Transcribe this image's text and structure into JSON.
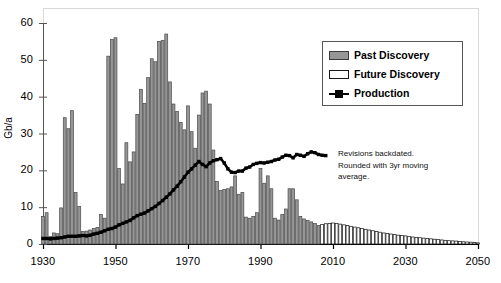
{
  "chart_data": {
    "type": "bar",
    "title": "",
    "xlabel": "",
    "ylabel": "Gb/a",
    "xlim": [
      1930,
      2050
    ],
    "ylim": [
      0,
      60
    ],
    "yticks": [
      0,
      10,
      20,
      30,
      40,
      50,
      60
    ],
    "xticks": [
      1930,
      1950,
      1970,
      1990,
      2010,
      2030,
      2050
    ],
    "xtick_labels": [
      "1930",
      "1950",
      "1970",
      "1990",
      "2010",
      "2030",
      "2050"
    ],
    "ytick_labels": [
      "0",
      "10",
      "20",
      "30",
      "40",
      "50",
      "60"
    ],
    "grid": false,
    "legend_position": "upper right",
    "annotations": [
      "Revisions backdated.",
      "Rounded with 3yr moving",
      "average."
    ],
    "legend": [
      {
        "label": "Past Discovery",
        "marker": "bar",
        "color": "#969696",
        "edge": "#3c3c3c"
      },
      {
        "label": "Future Discovery",
        "marker": "bar",
        "color": "#ffffff",
        "edge": "#1a1a1a"
      },
      {
        "label": "Production",
        "marker": "line-square",
        "color": "#000000"
      }
    ],
    "series": [
      {
        "name": "Past Discovery",
        "type": "bar",
        "color": "#969696",
        "x": [
          1930,
          1931,
          1932,
          1933,
          1934,
          1935,
          1936,
          1937,
          1938,
          1939,
          1940,
          1941,
          1942,
          1943,
          1944,
          1945,
          1946,
          1947,
          1948,
          1949,
          1950,
          1951,
          1952,
          1953,
          1954,
          1955,
          1956,
          1957,
          1958,
          1959,
          1960,
          1961,
          1962,
          1963,
          1964,
          1965,
          1966,
          1967,
          1968,
          1969,
          1970,
          1971,
          1972,
          1973,
          1974,
          1975,
          1976,
          1977,
          1978,
          1979,
          1980,
          1981,
          1982,
          1983,
          1984,
          1985,
          1986,
          1987,
          1988,
          1989,
          1990,
          1991,
          1992,
          1993,
          1994,
          1995,
          1996,
          1997,
          1998,
          1999,
          2000,
          2001,
          2002,
          2003,
          2004,
          2005,
          2006
        ],
        "values": [
          7.5,
          8.5,
          2.0,
          3.0,
          2.8,
          9.8,
          34.3,
          31.3,
          36.2,
          14.0,
          10.2,
          3.4,
          3.5,
          3.8,
          4.2,
          4.5,
          8.0,
          7.0,
          51.0,
          55.5,
          56.0,
          20.5,
          16.3,
          27.5,
          22.3,
          25.0,
          35.2,
          42.0,
          38.2,
          45.2,
          50.3,
          49.5,
          55.0,
          55.3,
          57.0,
          44.0,
          38.0,
          36.0,
          33.0,
          31.0,
          37.5,
          30.5,
          26.0,
          35.0,
          41.0,
          41.5,
          38.0,
          25.5,
          17.0,
          14.5,
          14.8,
          15.0,
          15.5,
          18.5,
          13.5,
          14.0,
          7.3,
          7.0,
          7.5,
          8.5,
          20.5,
          16.5,
          18.5,
          15.0,
          7.0,
          6.5,
          8.0,
          9.5,
          15.0,
          15.0,
          12.0,
          7.5,
          6.8,
          6.4,
          6.0,
          5.6,
          5.0
        ]
      },
      {
        "name": "Future Discovery",
        "type": "bar",
        "color": "#ffffff",
        "x": [
          2007,
          2008,
          2009,
          2010,
          2011,
          2012,
          2013,
          2014,
          2015,
          2016,
          2017,
          2018,
          2019,
          2020,
          2021,
          2022,
          2023,
          2024,
          2025,
          2026,
          2027,
          2028,
          2029,
          2030,
          2031,
          2032,
          2033,
          2034,
          2035,
          2036,
          2037,
          2038,
          2039,
          2040,
          2041,
          2042,
          2043,
          2044,
          2045,
          2046,
          2047,
          2048,
          2049,
          2050
        ],
        "values": [
          5.3,
          5.5,
          5.6,
          5.7,
          5.6,
          5.4,
          5.2,
          5.0,
          4.8,
          4.6,
          4.4,
          4.2,
          4.0,
          3.8,
          3.6,
          3.4,
          3.2,
          3.0,
          2.9,
          2.7,
          2.6,
          2.4,
          2.3,
          2.2,
          2.0,
          1.9,
          1.8,
          1.7,
          1.6,
          1.5,
          1.4,
          1.3,
          1.2,
          1.1,
          1.0,
          0.9,
          0.85,
          0.8,
          0.7,
          0.6,
          0.55,
          0.5,
          0.4,
          0.3
        ]
      },
      {
        "name": "Production",
        "type": "line",
        "color": "#000000",
        "x": [
          1930,
          1931,
          1932,
          1933,
          1934,
          1935,
          1936,
          1937,
          1938,
          1939,
          1940,
          1941,
          1942,
          1943,
          1944,
          1945,
          1946,
          1947,
          1948,
          1949,
          1950,
          1951,
          1952,
          1953,
          1954,
          1955,
          1956,
          1957,
          1958,
          1959,
          1960,
          1961,
          1962,
          1963,
          1964,
          1965,
          1966,
          1967,
          1968,
          1969,
          1970,
          1971,
          1972,
          1973,
          1974,
          1975,
          1976,
          1977,
          1978,
          1979,
          1980,
          1981,
          1982,
          1983,
          1984,
          1985,
          1986,
          1987,
          1988,
          1989,
          1990,
          1991,
          1992,
          1993,
          1994,
          1995,
          1996,
          1997,
          1998,
          1999,
          2000,
          2001,
          2002,
          2003,
          2004,
          2005,
          2006,
          2007,
          2008
        ],
        "values": [
          1.5,
          1.5,
          1.4,
          1.5,
          1.6,
          1.7,
          1.9,
          2.1,
          2.1,
          2.1,
          2.2,
          2.3,
          2.2,
          2.4,
          2.7,
          2.9,
          3.2,
          3.6,
          4.0,
          4.2,
          4.6,
          5.2,
          5.6,
          6.0,
          6.4,
          7.1,
          7.7,
          8.1,
          8.4,
          9.0,
          9.6,
          10.2,
          11.0,
          11.8,
          12.7,
          13.6,
          14.7,
          15.7,
          16.9,
          18.2,
          19.5,
          20.4,
          21.4,
          22.4,
          21.6,
          21.0,
          22.0,
          22.6,
          22.9,
          23.2,
          22.0,
          20.4,
          19.5,
          19.4,
          19.8,
          19.8,
          20.6,
          20.9,
          21.6,
          21.9,
          22.1,
          22.0,
          22.2,
          22.4,
          22.8,
          23.0,
          23.6,
          24.1,
          24.0,
          23.4,
          24.3,
          24.1,
          23.8,
          24.5,
          25.0,
          24.8,
          24.3,
          24.1,
          24.0
        ]
      }
    ]
  }
}
